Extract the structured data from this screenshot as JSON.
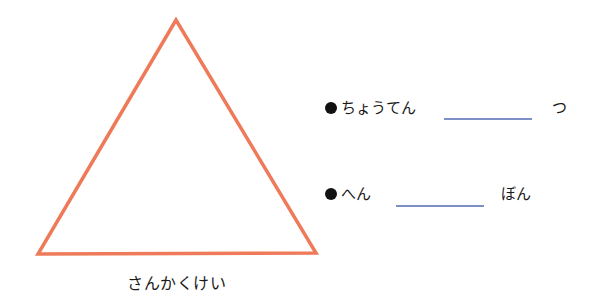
{
  "figure": {
    "shape": "triangle",
    "stroke_color": "#EE7A5A",
    "caption": "さんかくけい"
  },
  "questions": [
    {
      "label": "ちょうてん",
      "answer": "",
      "unit": "つ",
      "bullet": "●"
    },
    {
      "label": "へん",
      "answer": "",
      "unit": "ぼん",
      "bullet": "●"
    }
  ],
  "colors": {
    "blank_line": "#7D8FC4",
    "text": "#1A1A1A"
  }
}
